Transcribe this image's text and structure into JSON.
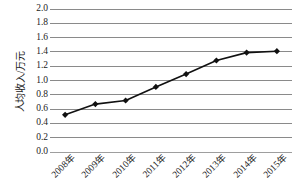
{
  "chart_data": {
    "type": "line",
    "title": "",
    "subtitle": "",
    "xlabel": "",
    "ylabel": "人均收入/万元",
    "categories": [
      "2008年",
      "2009年",
      "2010年",
      "2011年",
      "2012年",
      "2013年",
      "2014年",
      "2015年"
    ],
    "values": [
      0.52,
      0.67,
      0.72,
      0.91,
      1.09,
      1.28,
      1.39,
      1.41
    ],
    "series": [
      {
        "name": "人均收入",
        "values": [
          0.52,
          0.67,
          0.72,
          0.91,
          1.09,
          1.28,
          1.39,
          1.41
        ]
      }
    ],
    "ylim": [
      0.0,
      2.0
    ],
    "ytick_step": 0.2,
    "yticks": [
      "2.0",
      "1.8",
      "1.6",
      "1.4",
      "1.2",
      "1.0",
      "0.8",
      "0.6",
      "0.4",
      "0.2",
      "0.0"
    ],
    "ytick_values": [
      2.0,
      1.8,
      1.6,
      1.4,
      1.2,
      1.0,
      0.8,
      0.6,
      0.4,
      0.2,
      0.0
    ],
    "grid": "horizontal",
    "legend": "none",
    "marker": "diamond",
    "annotations": [],
    "colors": {
      "line": "#111111",
      "marker": "#111111",
      "grid": "#8a8a8a",
      "background": "#ffffff",
      "text": "#1c1c1c"
    }
  }
}
